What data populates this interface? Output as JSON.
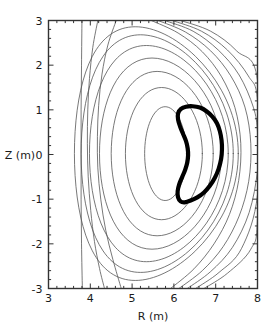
{
  "figure": {
    "background": "#ffffff",
    "frame_color": "#333333",
    "contour_color": "#555555",
    "boundary_color": "#000000"
  },
  "chart_data": {
    "type": "line",
    "title": "",
    "subtitle": "",
    "xlabel": "R (m)",
    "ylabel": "Z (m)",
    "xlim": [
      3,
      8
    ],
    "ylim": [
      -3,
      3
    ],
    "xticks": [
      3,
      4,
      5,
      6,
      7,
      8
    ],
    "xticklabels": [
      "3",
      "4",
      "5",
      "6",
      "7",
      "8"
    ],
    "yticks": [
      -3,
      -2,
      -1,
      0,
      1,
      2,
      3
    ],
    "yticklabels": [
      "-3",
      "-2",
      "-1",
      "0",
      "1",
      "2",
      "3"
    ],
    "minor_tick_step_x": 0.2,
    "minor_tick_step_y": 0.2,
    "grid": false,
    "legend": "none",
    "annotations": [],
    "series": [
      {
        "name": "plasma-boundary",
        "kind": "closed-contour",
        "linewidth": 4.2,
        "color": "#000000",
        "points": [
          [
            6.45,
            1.08
          ],
          [
            6.62,
            1.05
          ],
          [
            6.78,
            0.97
          ],
          [
            6.92,
            0.85
          ],
          [
            7.03,
            0.7
          ],
          [
            7.1,
            0.52
          ],
          [
            7.14,
            0.32
          ],
          [
            7.15,
            0.12
          ],
          [
            7.13,
            -0.1
          ],
          [
            7.07,
            -0.32
          ],
          [
            6.98,
            -0.52
          ],
          [
            6.86,
            -0.7
          ],
          [
            6.72,
            -0.85
          ],
          [
            6.56,
            -0.96
          ],
          [
            6.4,
            -1.03
          ],
          [
            6.26,
            -1.07
          ],
          [
            6.16,
            -1.05
          ],
          [
            6.1,
            -0.96
          ],
          [
            6.09,
            -0.82
          ],
          [
            6.13,
            -0.66
          ],
          [
            6.2,
            -0.5
          ],
          [
            6.27,
            -0.34
          ],
          [
            6.32,
            -0.18
          ],
          [
            6.34,
            -0.02
          ],
          [
            6.33,
            0.14
          ],
          [
            6.29,
            0.3
          ],
          [
            6.22,
            0.46
          ],
          [
            6.15,
            0.62
          ],
          [
            6.1,
            0.78
          ],
          [
            6.1,
            0.92
          ],
          [
            6.17,
            1.02
          ],
          [
            6.29,
            1.07
          ]
        ]
      },
      {
        "name": "flux-contour-1-innermost",
        "kind": "closed-contour",
        "linewidth": 0.8,
        "color": "#555555",
        "center": [
          5.8,
          0.02
        ],
        "rx": 0.5,
        "ry": 1.05
      },
      {
        "name": "flux-contour-2",
        "kind": "closed-contour",
        "linewidth": 0.8,
        "color": "#555555",
        "center": [
          5.76,
          0.02
        ],
        "rx": 0.92,
        "ry": 1.48
      },
      {
        "name": "flux-contour-3",
        "kind": "closed-contour",
        "linewidth": 0.8,
        "color": "#555555",
        "center": [
          5.72,
          0.02
        ],
        "rx": 1.22,
        "ry": 1.84
      },
      {
        "name": "flux-contour-4",
        "kind": "closed-contour",
        "linewidth": 0.8,
        "color": "#555555",
        "center": [
          5.68,
          0.02
        ],
        "rx": 1.46,
        "ry": 2.14
      },
      {
        "name": "flux-contour-5",
        "kind": "closed-contour",
        "linewidth": 0.8,
        "color": "#555555",
        "center": [
          5.64,
          0.02
        ],
        "rx": 1.66,
        "ry": 2.42
      },
      {
        "name": "flux-contour-6",
        "kind": "closed-contour",
        "linewidth": 0.8,
        "color": "#555555",
        "center": [
          5.6,
          0.02
        ],
        "rx": 1.82,
        "ry": 2.66
      },
      {
        "name": "flux-contour-7",
        "kind": "closed-contour",
        "linewidth": 0.8,
        "color": "#555555",
        "center": [
          5.58,
          0.02
        ],
        "rx": 1.96,
        "ry": 2.84
      },
      {
        "name": "flux-contour-8-open",
        "kind": "open-contour",
        "linewidth": 0.8,
        "color": "#555555",
        "points": [
          [
            4.62,
            3.0
          ],
          [
            4.42,
            2.45
          ],
          [
            4.28,
            1.8
          ],
          [
            4.2,
            1.1
          ],
          [
            4.17,
            0.4
          ],
          [
            4.18,
            -0.3
          ],
          [
            4.25,
            -1.0
          ],
          [
            4.37,
            -1.7
          ],
          [
            4.54,
            -2.35
          ],
          [
            4.74,
            -3.0
          ]
        ]
      },
      {
        "name": "flux-contour-9-open",
        "kind": "open-contour",
        "linewidth": 0.8,
        "color": "#555555",
        "points": [
          [
            4.18,
            3.0
          ],
          [
            4.06,
            2.4
          ],
          [
            3.98,
            1.7
          ],
          [
            3.94,
            1.0
          ],
          [
            3.93,
            0.25
          ],
          [
            3.95,
            -0.5
          ],
          [
            4.01,
            -1.25
          ],
          [
            4.1,
            -1.95
          ],
          [
            4.22,
            -2.55
          ],
          [
            4.34,
            -3.0
          ]
        ]
      },
      {
        "name": "flux-contour-10-open-vertical",
        "kind": "open-contour",
        "linewidth": 0.8,
        "color": "#555555",
        "points": [
          [
            3.8,
            3.0
          ],
          [
            3.79,
            2.0
          ],
          [
            3.78,
            1.0
          ],
          [
            3.78,
            0.0
          ],
          [
            3.78,
            -1.0
          ],
          [
            3.79,
            -2.0
          ],
          [
            3.81,
            -3.0
          ]
        ]
      },
      {
        "name": "flux-contour-outer-right-1",
        "kind": "open-contour",
        "linewidth": 0.8,
        "color": "#555555",
        "points": [
          [
            5.46,
            3.0
          ],
          [
            6.1,
            2.72
          ],
          [
            6.68,
            2.3
          ],
          [
            7.14,
            1.74
          ],
          [
            7.46,
            1.05
          ],
          [
            7.6,
            0.25
          ],
          [
            7.55,
            -0.58
          ],
          [
            7.33,
            -1.34
          ],
          [
            6.96,
            -2.0
          ],
          [
            6.48,
            -2.56
          ],
          [
            5.92,
            -3.0
          ]
        ]
      },
      {
        "name": "flux-contour-outer-right-2",
        "kind": "open-contour",
        "linewidth": 0.8,
        "color": "#555555",
        "points": [
          [
            5.62,
            3.0
          ],
          [
            6.28,
            2.74
          ],
          [
            6.88,
            2.32
          ],
          [
            7.36,
            1.76
          ],
          [
            7.7,
            1.06
          ],
          [
            7.84,
            0.24
          ],
          [
            7.79,
            -0.6
          ],
          [
            7.56,
            -1.38
          ],
          [
            7.18,
            -2.06
          ],
          [
            6.68,
            -2.6
          ],
          [
            6.12,
            -3.0
          ]
        ]
      },
      {
        "name": "flux-contour-outer-right-3",
        "kind": "open-contour",
        "linewidth": 0.8,
        "color": "#555555",
        "points": [
          [
            5.78,
            3.0
          ],
          [
            6.46,
            2.76
          ],
          [
            7.06,
            2.34
          ],
          [
            7.56,
            1.78
          ],
          [
            7.9,
            1.06
          ],
          [
            8.0,
            0.5
          ],
          [
            8.0,
            -0.35
          ],
          [
            7.8,
            -1.3
          ],
          [
            7.4,
            -2.08
          ],
          [
            6.88,
            -2.62
          ],
          [
            6.32,
            -3.0
          ]
        ]
      },
      {
        "name": "flux-contour-outer-right-4",
        "kind": "open-contour",
        "linewidth": 0.8,
        "color": "#555555",
        "points": [
          [
            5.96,
            3.0
          ],
          [
            6.66,
            2.76
          ],
          [
            7.28,
            2.34
          ],
          [
            7.78,
            1.76
          ],
          [
            8.0,
            1.2
          ],
          [
            8.0,
            -0.9
          ],
          [
            7.62,
            -2.1
          ],
          [
            7.08,
            -2.64
          ],
          [
            6.52,
            -3.0
          ]
        ]
      },
      {
        "name": "flux-contour-outer-right-5",
        "kind": "open-contour",
        "linewidth": 0.8,
        "color": "#555555",
        "points": [
          [
            6.16,
            3.0
          ],
          [
            6.88,
            2.76
          ],
          [
            7.5,
            2.32
          ],
          [
            8.0,
            1.66
          ],
          [
            8.0,
            -1.4
          ],
          [
            7.84,
            -2.12
          ],
          [
            7.28,
            -2.66
          ],
          [
            6.72,
            -3.0
          ]
        ]
      }
    ]
  }
}
